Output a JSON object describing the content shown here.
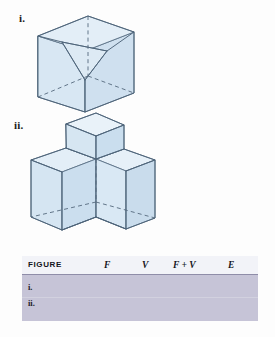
{
  "figures": [
    {
      "id": "figure-one",
      "label": "i.",
      "description": "cube-with-corner-tetrahedron-removed"
    },
    {
      "id": "figure-two",
      "label": "ii.",
      "description": "three-armed-y-shaped-solid-with-raised-cube"
    }
  ],
  "table": {
    "headers": {
      "figure": "FIGURE",
      "f": "F",
      "v": "V",
      "f_plus_v": "F + V",
      "e": "E"
    },
    "rows": [
      {
        "label": "i.",
        "f": "",
        "v": "",
        "f_plus_v": "",
        "e": ""
      },
      {
        "label": "ii.",
        "f": "",
        "v": "",
        "f_plus_v": "",
        "e": ""
      }
    ]
  },
  "colors": {
    "solid_fill_light": "#e2edf6",
    "solid_fill_mid": "#d3e3f0",
    "solid_fill_dark": "#c5daea",
    "edge_stroke": "#4d6378",
    "table_header_bg": "#f2f3f8",
    "table_body_bg": "#c6c4d7",
    "page_bg": "#fdfdfd"
  }
}
